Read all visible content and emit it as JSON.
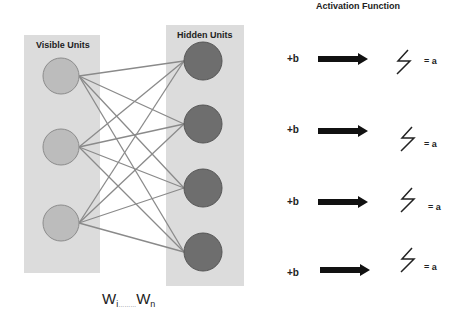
{
  "visible_layer": {
    "label": "Visible Units",
    "count": 3
  },
  "hidden_layer": {
    "label": "Hidden Units",
    "count": 4
  },
  "activation": {
    "title": "Activation Function",
    "rows": [
      {
        "bias": "+b",
        "output": "= a"
      },
      {
        "bias": "+b",
        "output": "= a"
      },
      {
        "bias": "+b",
        "output": "= a"
      },
      {
        "bias": "+b",
        "output": "= a"
      }
    ]
  },
  "weights": {
    "first": "W",
    "first_sub": "i",
    "dots": "………",
    "last": "W",
    "last_sub": "n"
  },
  "colors": {
    "layer_box": "#dcdcdc",
    "visible_node": "#bcbcbc",
    "hidden_node": "#6e6e6e",
    "edge": "#8a8a8a",
    "arrow": "#111111"
  }
}
